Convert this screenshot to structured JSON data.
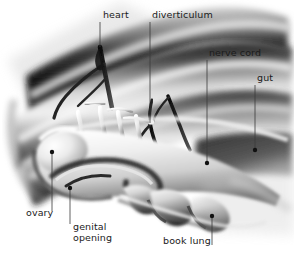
{
  "figure": {
    "style": "airbrushed grayscale anatomical illustration",
    "background_color": "#ffffff",
    "width": 294,
    "height": 263,
    "ink_color": "#1b1b1b",
    "leader_line_color": "#3a3a3a",
    "leader_dot_color": "#111111"
  },
  "labels": [
    {
      "id": "heart",
      "text": "heart",
      "x": 103,
      "y": 14,
      "multiline": false,
      "leader": {
        "x1": 100,
        "y1": 22,
        "x2": 100,
        "y2": 47
      },
      "dot": null
    },
    {
      "id": "diverticulum",
      "text": "diverticulum",
      "x": 152,
      "y": 14,
      "multiline": false,
      "leader": {
        "x1": 150,
        "y1": 22,
        "x2": 150,
        "y2": 123
      },
      "dot": null
    },
    {
      "id": "nerve-cord",
      "text": "nerve cord",
      "x": 209,
      "y": 52,
      "multiline": false,
      "leader": {
        "x1": 207,
        "y1": 60,
        "x2": 207,
        "y2": 162
      },
      "dot": {
        "x": 207,
        "y": 163
      }
    },
    {
      "id": "gut",
      "text": "gut",
      "x": 257,
      "y": 77,
      "multiline": false,
      "leader": {
        "x1": 255,
        "y1": 85,
        "x2": 255,
        "y2": 149
      },
      "dot": {
        "x": 255,
        "y": 150
      }
    },
    {
      "id": "ovary",
      "text": "ovary",
      "x": 26,
      "y": 212,
      "multiline": false,
      "leader": {
        "x1": 52,
        "y1": 154,
        "x2": 52,
        "y2": 211
      },
      "dot": {
        "x": 52,
        "y": 152
      }
    },
    {
      "id": "genital-opening",
      "text": "genital\nopening",
      "line1": "genital",
      "line2": "opening",
      "x": 73,
      "y": 226,
      "multiline": true,
      "leader": {
        "x1": 70,
        "y1": 190,
        "x2": 70,
        "y2": 224
      },
      "dot": {
        "x": 70,
        "y": 188
      }
    },
    {
      "id": "book-lung",
      "text": "book lung",
      "x": 163,
      "y": 240,
      "multiline": false,
      "leader": {
        "x1": 212,
        "y1": 218,
        "x2": 212,
        "y2": 245
      },
      "dot": {
        "x": 212,
        "y": 216
      }
    }
  ],
  "structures": [
    {
      "id": "heart",
      "name": "heart"
    },
    {
      "id": "diverticulum",
      "name": "diverticulum"
    },
    {
      "id": "nerve-cord",
      "name": "nerve cord"
    },
    {
      "id": "gut",
      "name": "gut"
    },
    {
      "id": "ovary",
      "name": "ovary"
    },
    {
      "id": "genital-opening",
      "name": "genital opening"
    },
    {
      "id": "book-lung",
      "name": "book lung"
    }
  ]
}
